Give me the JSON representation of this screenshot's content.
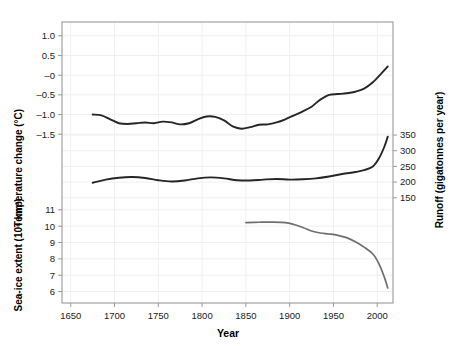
{
  "figure": {
    "background_color": "#ffffff",
    "frame_color": "#9a9a9a",
    "grid_color": "#f0f0f0",
    "x_title": "Year"
  },
  "axes": {
    "temperature": {
      "title": "Temperature change (°C)",
      "ticks": [
        "1.0",
        "0.5",
        "–0",
        "–0.5",
        "–1.0",
        "–1.5"
      ],
      "tick_values": [
        1.0,
        0.5,
        0.0,
        -0.5,
        -1.0,
        -1.5
      ],
      "side": "left"
    },
    "runoff": {
      "title": "Runoff (gigatonnes per year)",
      "ticks": [
        "350",
        "300",
        "250",
        "200",
        "150"
      ],
      "tick_values": [
        350,
        300,
        250,
        200,
        150
      ],
      "side": "right"
    },
    "seaice": {
      "title": "Sea-ice extent (10⁶ km²)",
      "ticks": [
        "11",
        "10",
        "9",
        "8",
        "7",
        "6"
      ],
      "tick_values": [
        11,
        10,
        9,
        8,
        7,
        6
      ],
      "side": "left"
    },
    "year": {
      "title": "Year",
      "ticks": [
        "1650",
        "1700",
        "1750",
        "1800",
        "1850",
        "1900",
        "1950",
        "2000"
      ],
      "tick_values": [
        1650,
        1700,
        1750,
        1800,
        1850,
        1900,
        1950,
        2000
      ]
    }
  },
  "chart_data": {
    "type": "line",
    "title": "",
    "xlabel": "Year",
    "ylabel": "",
    "xlim": [
      1640,
      2018
    ],
    "grid": true,
    "legend": "none",
    "panels": [
      {
        "name": "temperature",
        "ylabel": "Temperature change (°C)",
        "ylim": [
          -1.9,
          1.35
        ],
        "axis_side": "left",
        "color": "#262626",
        "x": [
          1675,
          1685,
          1695,
          1705,
          1715,
          1725,
          1735,
          1745,
          1755,
          1765,
          1775,
          1785,
          1795,
          1805,
          1815,
          1825,
          1835,
          1845,
          1855,
          1865,
          1875,
          1885,
          1895,
          1905,
          1915,
          1925,
          1935,
          1945,
          1955,
          1965,
          1975,
          1985,
          1995,
          2005,
          2012
        ],
        "y": [
          -1.0,
          -1.02,
          -1.12,
          -1.22,
          -1.24,
          -1.22,
          -1.2,
          -1.22,
          -1.18,
          -1.2,
          -1.25,
          -1.22,
          -1.12,
          -1.05,
          -1.06,
          -1.15,
          -1.3,
          -1.36,
          -1.32,
          -1.26,
          -1.25,
          -1.2,
          -1.12,
          -1.02,
          -0.92,
          -0.8,
          -0.62,
          -0.5,
          -0.48,
          -0.46,
          -0.42,
          -0.34,
          -0.18,
          0.05,
          0.22
        ]
      },
      {
        "name": "runoff",
        "ylabel": "Runoff (gigatonnes per year)",
        "ylim": [
          95,
          430
        ],
        "axis_side": "right",
        "color": "#262626",
        "x": [
          1675,
          1690,
          1705,
          1720,
          1735,
          1750,
          1765,
          1780,
          1795,
          1810,
          1825,
          1840,
          1855,
          1870,
          1885,
          1900,
          1915,
          1930,
          1945,
          1960,
          1975,
          1985,
          1995,
          2002,
          2008,
          2012
        ],
        "y": [
          198,
          208,
          214,
          216,
          213,
          206,
          202,
          205,
          212,
          215,
          212,
          206,
          205,
          208,
          210,
          208,
          209,
          212,
          218,
          226,
          232,
          238,
          250,
          276,
          312,
          345
        ]
      },
      {
        "name": "seaice",
        "ylabel": "Sea-ice extent (10⁶ km²)",
        "ylim": [
          5.3,
          11.6
        ],
        "axis_side": "left",
        "color": "#6e6e6e",
        "x": [
          1850,
          1865,
          1880,
          1895,
          1905,
          1915,
          1925,
          1935,
          1945,
          1955,
          1965,
          1975,
          1985,
          1995,
          2002,
          2008,
          2012
        ],
        "y": [
          10.22,
          10.24,
          10.25,
          10.22,
          10.1,
          9.92,
          9.7,
          9.58,
          9.52,
          9.44,
          9.3,
          9.05,
          8.72,
          8.3,
          7.7,
          6.9,
          6.22
        ]
      }
    ]
  }
}
